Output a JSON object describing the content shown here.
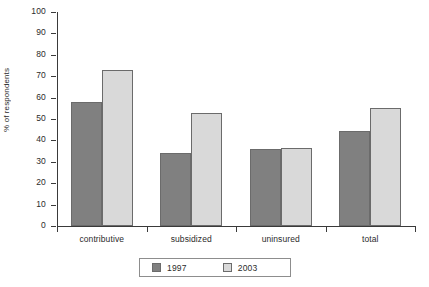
{
  "chart_data": {
    "type": "bar",
    "title": "",
    "subtitle": "",
    "xlabel": "",
    "ylabel": "% of respondents",
    "categories": [
      "contributive",
      "subsidized",
      "uninsured",
      "total"
    ],
    "series": [
      {
        "name": "1997",
        "color": "#808080",
        "values": [
          58,
          34,
          36,
          44.5
        ]
      },
      {
        "name": "2003",
        "color": "#d9d9d9",
        "values": [
          73,
          53,
          36.5,
          55
        ]
      }
    ],
    "ylim": [
      0,
      100
    ],
    "ytick_step": 10,
    "yticks": [
      0,
      10,
      20,
      30,
      40,
      50,
      60,
      70,
      80,
      90,
      100
    ],
    "ytick_labels": [
      "0",
      "10",
      "20",
      "30",
      "40",
      "50",
      "60",
      "70",
      "80",
      "90",
      "100"
    ],
    "grid": false,
    "legend_position": "bottom-center",
    "legend_entries": [
      "1997",
      "2003"
    ]
  }
}
